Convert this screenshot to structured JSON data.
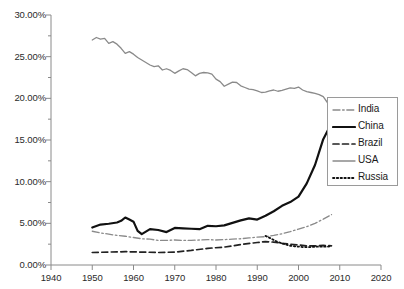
{
  "chart_data": {
    "type": "line",
    "title": "",
    "xlabel": "",
    "ylabel": "",
    "xlim": [
      1940,
      2020
    ],
    "ylim": [
      0,
      0.3
    ],
    "grid": false,
    "legend_position": "right",
    "x_ticks": [
      "1940",
      "1950",
      "1960",
      "1970",
      "1980",
      "1990",
      "2000",
      "2010",
      "2020"
    ],
    "y_ticks": [
      "0.00%",
      "5.00%",
      "10.00%",
      "15.00%",
      "20.00%",
      "25.00%",
      "30.00%"
    ],
    "y_tick_values": [
      0,
      5,
      10,
      15,
      20,
      25,
      30
    ],
    "x_tick_values": [
      1940,
      1950,
      1960,
      1970,
      1980,
      1990,
      2000,
      2010,
      2020
    ],
    "series": [
      {
        "name": "India",
        "style": "dash-dot",
        "color": "#8a8a8a",
        "width": 1.3,
        "x": [
          1950,
          1952,
          1954,
          1956,
          1958,
          1960,
          1962,
          1964,
          1966,
          1968,
          1970,
          1972,
          1974,
          1976,
          1978,
          1980,
          1982,
          1984,
          1986,
          1988,
          1990,
          1992,
          1994,
          1996,
          1998,
          2000,
          2002,
          2004,
          2006,
          2008
        ],
        "values": [
          4.05,
          3.85,
          3.7,
          3.55,
          3.45,
          3.3,
          3.15,
          3.1,
          2.95,
          2.95,
          3.0,
          2.95,
          2.95,
          3.0,
          3.05,
          3.0,
          3.05,
          3.1,
          3.15,
          3.25,
          3.35,
          3.4,
          3.55,
          3.75,
          4.0,
          4.3,
          4.6,
          5.0,
          5.5,
          6.05
        ]
      },
      {
        "name": "China",
        "style": "solid",
        "color": "#111111",
        "width": 2.2,
        "x": [
          1950,
          1952,
          1954,
          1956,
          1957,
          1958,
          1959,
          1960,
          1961,
          1962,
          1964,
          1966,
          1968,
          1970,
          1972,
          1974,
          1976,
          1978,
          1980,
          1982,
          1984,
          1986,
          1988,
          1990,
          1992,
          1994,
          1996,
          1998,
          2000,
          2002,
          2004,
          2006,
          2008
        ],
        "values": [
          4.5,
          4.85,
          4.95,
          5.1,
          5.3,
          5.7,
          5.45,
          5.2,
          4.1,
          3.7,
          4.3,
          4.2,
          3.95,
          4.45,
          4.4,
          4.35,
          4.3,
          4.7,
          4.65,
          4.75,
          5.05,
          5.35,
          5.6,
          5.45,
          5.9,
          6.45,
          7.1,
          7.55,
          8.2,
          9.8,
          12.0,
          15.1,
          17.0
        ]
      },
      {
        "name": "Brazil",
        "style": "dashed",
        "color": "#222222",
        "width": 1.7,
        "x": [
          1950,
          1954,
          1958,
          1962,
          1966,
          1970,
          1974,
          1978,
          1982,
          1986,
          1990,
          1992,
          1994,
          1996,
          1998,
          2000,
          2002,
          2004,
          2006,
          2008
        ],
        "values": [
          1.5,
          1.55,
          1.6,
          1.55,
          1.5,
          1.55,
          1.75,
          2.0,
          2.15,
          2.45,
          2.7,
          2.8,
          2.75,
          2.6,
          2.5,
          2.4,
          2.3,
          2.3,
          2.35,
          2.3
        ]
      },
      {
        "name": "USA",
        "style": "solid",
        "color": "#8a8a8a",
        "width": 1.3,
        "x": [
          1950,
          1951,
          1952,
          1953,
          1954,
          1955,
          1956,
          1957,
          1958,
          1959,
          1960,
          1961,
          1962,
          1963,
          1964,
          1965,
          1966,
          1967,
          1968,
          1969,
          1970,
          1971,
          1972,
          1973,
          1974,
          1975,
          1976,
          1977,
          1978,
          1979,
          1980,
          1981,
          1982,
          1983,
          1984,
          1985,
          1986,
          1987,
          1988,
          1989,
          1990,
          1991,
          1992,
          1993,
          1994,
          1995,
          1996,
          1997,
          1998,
          1999,
          2000,
          2001,
          2002,
          2003,
          2004,
          2005,
          2006,
          2007,
          2008
        ],
        "values": [
          27.0,
          27.3,
          27.1,
          27.2,
          26.6,
          26.8,
          26.5,
          26.0,
          25.4,
          25.6,
          25.3,
          24.9,
          24.6,
          24.3,
          24.0,
          23.8,
          23.9,
          23.4,
          23.55,
          23.35,
          23.0,
          23.3,
          23.55,
          23.45,
          23.1,
          22.7,
          23.0,
          23.1,
          23.05,
          22.9,
          22.3,
          22.0,
          21.45,
          21.7,
          21.95,
          21.9,
          21.5,
          21.3,
          21.1,
          21.05,
          20.9,
          20.7,
          20.75,
          20.9,
          21.0,
          20.85,
          20.95,
          21.1,
          21.25,
          21.2,
          21.35,
          21.0,
          20.8,
          20.7,
          20.6,
          20.45,
          20.2,
          19.5,
          18.1
        ]
      },
      {
        "name": "Russia",
        "style": "dotted",
        "color": "#111111",
        "width": 1.8,
        "x": [
          1992,
          1993,
          1994,
          1995,
          1996,
          1997,
          1998,
          1999,
          2000,
          2001,
          2002,
          2003,
          2004,
          2005,
          2006,
          2007,
          2008
        ],
        "values": [
          3.5,
          3.25,
          3.0,
          2.75,
          2.6,
          2.45,
          2.3,
          2.25,
          2.2,
          2.15,
          2.15,
          2.15,
          2.2,
          2.2,
          2.2,
          2.2,
          2.25
        ]
      }
    ]
  },
  "legend": {
    "items": [
      {
        "label": "India"
      },
      {
        "label": "China"
      },
      {
        "label": "Brazil"
      },
      {
        "label": "USA"
      },
      {
        "label": "Russia"
      }
    ]
  },
  "axes": {
    "axis_color": "#8a8a8a",
    "tick_color": "#8a8a8a"
  }
}
